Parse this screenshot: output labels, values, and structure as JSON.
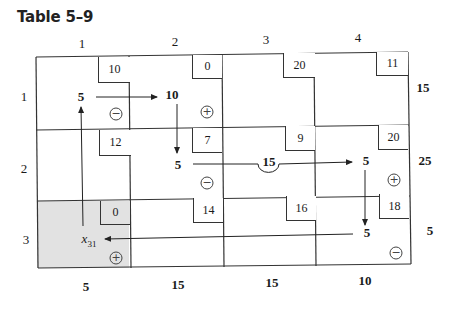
{
  "title": "Table 5–9",
  "column_headers": [
    "1",
    "2",
    "3",
    "4"
  ],
  "row_headers": [
    "1",
    "2",
    "3"
  ],
  "supply": [
    "15",
    "25",
    "5"
  ],
  "demand": [
    "5",
    "15",
    "15",
    "10"
  ],
  "costs": [
    [
      "10",
      "0",
      "20",
      "11"
    ],
    [
      "12",
      "7",
      "9",
      "20"
    ],
    [
      "0",
      "14",
      "16",
      "18"
    ]
  ],
  "allocations": {
    "r1c1": "5",
    "r1c2": "10",
    "r2c2": "5",
    "r2c3": "15",
    "r2c4": "5",
    "r3c4": "5"
  },
  "entering_variable": {
    "symbol": "x",
    "subscript": "31",
    "cell": "r3c1"
  },
  "loop_signs": {
    "r1c1": "−",
    "r1c2": "+",
    "r2c2": "−",
    "r2c4": "+",
    "r3c4": "−",
    "r3c1": "+"
  },
  "colors": {
    "line": "#333333",
    "shaded_cell": "#e2e2e2"
  }
}
